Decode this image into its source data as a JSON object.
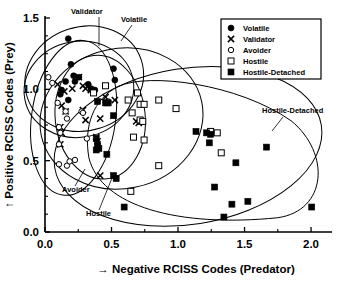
{
  "chart_data": {
    "type": "scatter",
    "title": "",
    "xlabel": "→ Negative RCISS Codes (Predator)",
    "ylabel": "↑ Positive RCISS Codes (Prey)",
    "xlim": [
      0.0,
      2.15
    ],
    "ylim": [
      0.0,
      1.5
    ],
    "xticks": [
      0.0,
      0.5,
      1.0,
      1.5,
      2.0
    ],
    "xticklabels": [
      "0.0",
      "0.5",
      "1.0",
      "1.5",
      "2.0"
    ],
    "yticks": [
      0.0,
      0.5,
      1.0,
      1.5
    ],
    "yticklabels": [
      "0.0",
      "0.5",
      "1.0",
      "1.5"
    ],
    "xminorticks": [
      0.25,
      0.75,
      1.25,
      1.75
    ],
    "yminorticks": [
      0.125,
      0.25,
      0.375,
      0.625,
      0.75,
      0.875,
      1.125,
      1.25,
      1.375
    ],
    "grid": false,
    "legend_position": "top-right",
    "series": [
      {
        "name": "Volatile",
        "marker": "filled-circle",
        "points": [
          [
            0.175,
            1.355
          ],
          [
            0.195,
            1.175
          ],
          [
            0.215,
            1.095
          ],
          [
            0.255,
            1.085
          ],
          [
            0.155,
            1.055
          ],
          [
            0.225,
            1.055
          ],
          [
            0.125,
            0.995
          ],
          [
            0.115,
            0.965
          ],
          [
            0.175,
            0.925
          ],
          [
            0.325,
            1.035
          ],
          [
            0.345,
            1.005
          ],
          [
            0.515,
            1.145
          ],
          [
            0.525,
            1.065
          ],
          [
            0.375,
            0.995
          ]
        ]
      },
      {
        "name": "Validator",
        "marker": "x",
        "points": [
          [
            0.095,
            1.035
          ],
          [
            0.145,
            0.985
          ],
          [
            0.205,
            1.005
          ],
          [
            0.255,
            1.085
          ],
          [
            0.285,
            1.025
          ],
          [
            0.305,
            1.005
          ],
          [
            0.345,
            0.995
          ],
          [
            0.125,
            0.885
          ],
          [
            0.155,
            0.845
          ],
          [
            0.285,
            0.855
          ],
          [
            0.305,
            0.785
          ],
          [
            0.115,
            0.735
          ],
          [
            0.125,
            0.695
          ],
          [
            0.385,
            0.665
          ],
          [
            0.395,
            0.635
          ],
          [
            0.415,
            0.795
          ],
          [
            0.455,
            0.945
          ],
          [
            0.465,
            0.905
          ],
          [
            0.525,
            0.925
          ],
          [
            0.685,
            0.775
          ],
          [
            0.705,
            0.765
          ],
          [
            0.115,
            0.615
          ],
          [
            0.415,
            0.395
          ]
        ]
      },
      {
        "name": "Avoider",
        "marker": "open-circle",
        "points": [
          [
            0.025,
            1.085
          ],
          [
            0.055,
            1.045
          ],
          [
            0.095,
            0.905
          ],
          [
            0.155,
            0.845
          ],
          [
            0.165,
            0.795
          ],
          [
            0.275,
            0.845
          ],
          [
            0.285,
            0.835
          ],
          [
            0.105,
            0.735
          ],
          [
            0.115,
            0.695
          ],
          [
            0.105,
            0.615
          ],
          [
            0.315,
            0.655
          ],
          [
            0.475,
            0.915
          ],
          [
            0.105,
            0.475
          ],
          [
            0.165,
            0.465
          ],
          [
            0.185,
            0.495
          ],
          [
            0.225,
            0.505
          ]
        ]
      },
      {
        "name": "Hostile",
        "marker": "open-square",
        "points": [
          [
            0.455,
            1.025
          ],
          [
            0.365,
            0.975
          ],
          [
            0.695,
            0.975
          ],
          [
            0.625,
            0.925
          ],
          [
            0.855,
            0.925
          ],
          [
            0.715,
            0.895
          ],
          [
            0.745,
            0.895
          ],
          [
            0.985,
            0.865
          ],
          [
            0.655,
            0.835
          ],
          [
            0.715,
            0.785
          ],
          [
            0.735,
            0.775
          ],
          [
            0.665,
            0.665
          ],
          [
            0.745,
            0.645
          ],
          [
            1.245,
            0.705
          ],
          [
            1.295,
            0.695
          ],
          [
            1.325,
            0.555
          ],
          [
            0.855,
            0.465
          ],
          [
            0.645,
            0.285
          ]
        ]
      },
      {
        "name": "Hostile-Detached",
        "marker": "filled-square",
        "points": [
          [
            0.395,
            0.915
          ],
          [
            0.455,
            0.905
          ],
          [
            0.475,
            0.905
          ],
          [
            0.515,
            0.815
          ],
          [
            0.385,
            0.655
          ],
          [
            0.395,
            0.615
          ],
          [
            0.385,
            0.575
          ],
          [
            0.405,
            0.585
          ],
          [
            0.465,
            0.545
          ],
          [
            1.135,
            0.705
          ],
          [
            1.215,
            0.695
          ],
          [
            1.245,
            0.685
          ],
          [
            1.235,
            0.625
          ],
          [
            1.665,
            0.595
          ],
          [
            1.435,
            0.485
          ],
          [
            0.515,
            0.395
          ],
          [
            0.535,
            0.375
          ],
          [
            1.275,
            0.315
          ],
          [
            0.595,
            0.175
          ],
          [
            1.405,
            0.195
          ],
          [
            1.525,
            0.215
          ],
          [
            1.345,
            0.105
          ],
          [
            2.005,
            0.175
          ]
        ]
      }
    ],
    "cluster_labels": [
      {
        "text": "Validator"
      },
      {
        "text": "Volatile"
      },
      {
        "text": "Avoider"
      },
      {
        "text": "Hostile"
      },
      {
        "text": "Hostile-Detached"
      }
    ]
  },
  "legend": {
    "items": [
      {
        "label": "Volatile",
        "marker": "filled-circle"
      },
      {
        "label": "Validator",
        "marker": "x"
      },
      {
        "label": "Avoider",
        "marker": "open-circle"
      },
      {
        "label": "Hostile",
        "marker": "open-square"
      },
      {
        "label": "Hostile-Detached",
        "marker": "filled-square"
      }
    ]
  }
}
